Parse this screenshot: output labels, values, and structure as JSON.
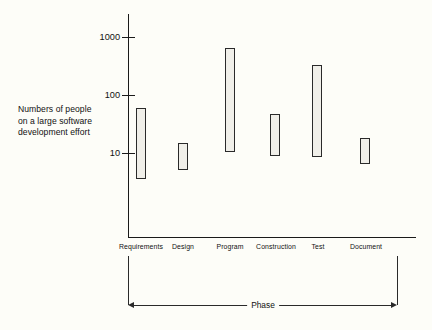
{
  "chart_data": {
    "type": "bar",
    "subtype": "floating-range-bar",
    "title": "",
    "xlabel": "Phase",
    "ylabel": "Numbers of people on a large software development effort",
    "ylabel_lines": [
      "Numbers of people",
      "on a large software",
      "development effort"
    ],
    "yscale": "log",
    "ylim": [
      1,
      2000
    ],
    "ytick_labels": [
      "1000",
      "100",
      "10"
    ],
    "ytick_values": [
      1000,
      100,
      10
    ],
    "grid": false,
    "legend": null,
    "categories": [
      "Requirements",
      "Design",
      "Program",
      "Construction",
      "Test",
      "Document"
    ],
    "series": [
      {
        "name": "range low",
        "values": [
          3.5,
          5.0,
          10.5,
          9.0,
          8.5,
          6.5
        ]
      },
      {
        "name": "range high",
        "values": [
          60,
          15,
          650,
          47,
          330,
          18
        ]
      }
    ],
    "bars": [
      {
        "category": "Requirements",
        "low": 3.5,
        "high": 60
      },
      {
        "category": "Design",
        "low": 5.0,
        "high": 15
      },
      {
        "category": "Program",
        "low": 10.5,
        "high": 650
      },
      {
        "category": "Construction",
        "low": 9.0,
        "high": 47
      },
      {
        "category": "Test",
        "low": 8.5,
        "high": 330
      },
      {
        "category": "Document",
        "low": 6.5,
        "high": 18
      }
    ],
    "annotations": [
      {
        "name": "phase-bracket",
        "text": "Phase",
        "style": "double-headed-arrow-under-axis"
      }
    ],
    "colors": {
      "background": "#fdfdf8",
      "axis": "#1a1a1a",
      "bar_fill": "#f0efe9",
      "bar_stipple": "#8d8d86",
      "bar_border": "#2a2a2a",
      "text": "#111111"
    }
  },
  "geometry": {
    "y_pixel_for_1000": 37,
    "y_pixel_for_100": 95,
    "y_pixel_for_10": 153,
    "decade_px": 58,
    "axis_origin_x": 128,
    "axis_baseline_y": 237,
    "bar_centers_x": [
      141,
      183,
      230,
      275,
      317,
      365
    ],
    "bar_width_px": 10
  }
}
